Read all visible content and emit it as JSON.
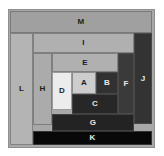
{
  "diagram": {
    "background_color": "#ffffff",
    "frame": {
      "fill_color": "#a8a8a8",
      "border_color": "#8e8e8e"
    },
    "label_colors": {
      "on_light": "#1d1d1d",
      "on_dark": "#e9e9e9"
    },
    "rects": [
      {
        "label": "M",
        "x": 10,
        "y": 11,
        "w": 142,
        "h": 22,
        "fill": "#a0a0a0",
        "text": "dark"
      },
      {
        "label": "L",
        "x": 10,
        "y": 33,
        "w": 23,
        "h": 112,
        "fill": "#b4b4b4",
        "text": "dark"
      },
      {
        "label": "J",
        "x": 134,
        "y": 33,
        "w": 18,
        "h": 91,
        "fill": "#333333",
        "text": "light"
      },
      {
        "label": "I",
        "x": 33,
        "y": 33,
        "w": 101,
        "h": 20,
        "fill": "#b0b0b0",
        "text": "dark"
      },
      {
        "label": "H",
        "x": 33,
        "y": 53,
        "w": 19,
        "h": 72,
        "fill": "#ababab",
        "text": "dark"
      },
      {
        "label": "E",
        "x": 52,
        "y": 53,
        "w": 66,
        "h": 19,
        "fill": "#b0b0b0",
        "text": "dark"
      },
      {
        "label": "F",
        "x": 118,
        "y": 53,
        "w": 16,
        "h": 61,
        "fill": "#3a3a3a",
        "text": "light"
      },
      {
        "label": "D",
        "x": 52,
        "y": 72,
        "w": 20,
        "h": 38,
        "fill": "#ececec",
        "text": "dark"
      },
      {
        "label": "A",
        "x": 72,
        "y": 72,
        "w": 24,
        "h": 22,
        "fill": "#cdcdcd",
        "text": "dark"
      },
      {
        "label": "B",
        "x": 96,
        "y": 72,
        "w": 22,
        "h": 22,
        "fill": "#313131",
        "text": "light"
      },
      {
        "label": "C",
        "x": 72,
        "y": 94,
        "w": 46,
        "h": 20,
        "fill": "#272727",
        "text": "light"
      },
      {
        "label": "G",
        "x": 52,
        "y": 114,
        "w": 82,
        "h": 17,
        "fill": "#232323",
        "text": "light"
      },
      {
        "label": "K",
        "x": 33,
        "y": 131,
        "w": 119,
        "h": 14,
        "fill": "#080808",
        "text": "light"
      }
    ]
  }
}
